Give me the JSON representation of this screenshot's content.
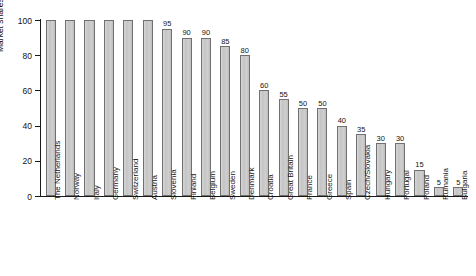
{
  "chart_data": {
    "type": "bar",
    "title": "",
    "xlabel": "",
    "ylabel": "Market shares, %",
    "ylim": [
      0,
      100
    ],
    "yticks": [
      0,
      20,
      40,
      60,
      80,
      100
    ],
    "grid": false,
    "legend": null,
    "value_labels_shown_from_index": 6,
    "categories": [
      "The Netherlands",
      "Norway",
      "Italy",
      "Germany",
      "Switzerland",
      "Austria",
      "Slovenia",
      "Finland",
      "Belgium",
      "Sweden",
      "Denmark",
      "Croatia",
      "Great Britain",
      "France",
      "Greece",
      "Spain",
      "Czech/Slovakia",
      "Hungary",
      "Portugal",
      "Poland",
      "Rumania",
      "Bulgaria"
    ],
    "values": [
      100,
      100,
      100,
      100,
      100,
      100,
      95,
      90,
      90,
      85,
      80,
      60,
      55,
      50,
      50,
      40,
      35,
      30,
      30,
      15,
      5,
      5
    ],
    "value_labels": [
      "",
      "",
      "",
      "",
      "",
      "",
      "95",
      "90",
      "90",
      "85",
      "80",
      "60",
      "55",
      "50",
      "50",
      "40",
      "35",
      "30",
      "30",
      "15",
      "5",
      "5"
    ]
  },
  "colors": {
    "bar_fill": "#c9c9c9",
    "bar_border": "#707070",
    "axis": "#1a1a1a",
    "text": "#141414",
    "background": "#ffffff"
  }
}
